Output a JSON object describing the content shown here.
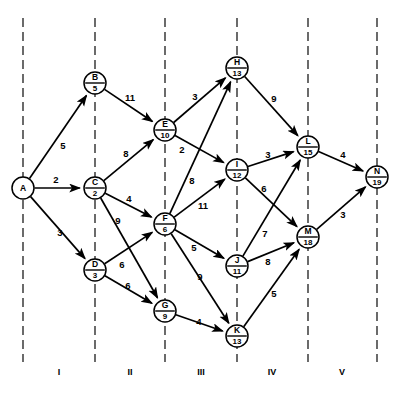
{
  "diagram": {
    "type": "activity-on-node network",
    "node_radius": 11,
    "width": 405,
    "height": 397
  },
  "chart_data": {
    "type": "diagram",
    "nodes": [
      {
        "id": "A",
        "label": "A",
        "value": "",
        "x": 23,
        "y": 188,
        "stage": 0
      },
      {
        "id": "B",
        "label": "B",
        "value": "5",
        "x": 95,
        "y": 83,
        "stage": 1
      },
      {
        "id": "C",
        "label": "C",
        "value": "2",
        "x": 95,
        "y": 188,
        "stage": 1
      },
      {
        "id": "D",
        "label": "D",
        "value": "3",
        "x": 95,
        "y": 270,
        "stage": 1
      },
      {
        "id": "E",
        "label": "E",
        "value": "10",
        "x": 165,
        "y": 130,
        "stage": 2
      },
      {
        "id": "F",
        "label": "F",
        "value": "6",
        "x": 165,
        "y": 224,
        "stage": 2
      },
      {
        "id": "G",
        "label": "G",
        "value": "9",
        "x": 165,
        "y": 311,
        "stage": 2
      },
      {
        "id": "H",
        "label": "H",
        "value": "13",
        "x": 237,
        "y": 68,
        "stage": 3
      },
      {
        "id": "I",
        "label": "I",
        "value": "12",
        "x": 237,
        "y": 170,
        "stage": 3
      },
      {
        "id": "J",
        "label": "J",
        "value": "11",
        "x": 237,
        "y": 266,
        "stage": 3
      },
      {
        "id": "K",
        "label": "K",
        "value": "13",
        "x": 237,
        "y": 336,
        "stage": 3
      },
      {
        "id": "L",
        "label": "L",
        "value": "15",
        "x": 308,
        "y": 147,
        "stage": 4
      },
      {
        "id": "M",
        "label": "M",
        "value": "18",
        "x": 308,
        "y": 237,
        "stage": 4
      },
      {
        "id": "N",
        "label": "N",
        "value": "19",
        "x": 377,
        "y": 177,
        "stage": 5
      }
    ],
    "edges": [
      {
        "from": "A",
        "to": "B",
        "weight": 5,
        "lx": 63,
        "ly": 146
      },
      {
        "from": "A",
        "to": "C",
        "weight": 2,
        "lx": 56,
        "ly": 180
      },
      {
        "from": "A",
        "to": "D",
        "weight": 3,
        "lx": 60,
        "ly": 233
      },
      {
        "from": "B",
        "to": "E",
        "weight": 11,
        "lx": 130,
        "ly": 98
      },
      {
        "from": "C",
        "to": "E",
        "weight": 8,
        "lx": 126,
        "ly": 154
      },
      {
        "from": "C",
        "to": "F",
        "weight": 4,
        "lx": 129,
        "ly": 199
      },
      {
        "from": "C",
        "to": "G",
        "weight": 9,
        "lx": 118,
        "ly": 221
      },
      {
        "from": "D",
        "to": "F",
        "weight": 6,
        "lx": 122,
        "ly": 265
      },
      {
        "from": "D",
        "to": "G",
        "weight": 6,
        "lx": 128,
        "ly": 286
      },
      {
        "from": "E",
        "to": "H",
        "weight": 3,
        "lx": 195,
        "ly": 97
      },
      {
        "from": "E",
        "to": "I",
        "weight": 2,
        "lx": 182,
        "ly": 150
      },
      {
        "from": "F",
        "to": "H",
        "weight": 8,
        "lx": 192,
        "ly": 181
      },
      {
        "from": "F",
        "to": "I",
        "weight": 11,
        "lx": 203,
        "ly": 206
      },
      {
        "from": "F",
        "to": "J",
        "weight": 5,
        "lx": 194,
        "ly": 248
      },
      {
        "from": "F",
        "to": "K",
        "weight": 9,
        "lx": 200,
        "ly": 277
      },
      {
        "from": "G",
        "to": "K",
        "weight": 4,
        "lx": 199,
        "ly": 322
      },
      {
        "from": "H",
        "to": "L",
        "weight": 9,
        "lx": 274,
        "ly": 99
      },
      {
        "from": "I",
        "to": "L",
        "weight": 3,
        "lx": 268,
        "ly": 155
      },
      {
        "from": "I",
        "to": "M",
        "weight": 6,
        "lx": 264,
        "ly": 189
      },
      {
        "from": "J",
        "to": "L",
        "weight": 7,
        "lx": 265,
        "ly": 234
      },
      {
        "from": "J",
        "to": "M",
        "weight": 8,
        "lx": 268,
        "ly": 262
      },
      {
        "from": "K",
        "to": "M",
        "weight": 5,
        "lx": 274,
        "ly": 294
      },
      {
        "from": "L",
        "to": "N",
        "weight": 4,
        "lx": 343,
        "ly": 155
      },
      {
        "from": "M",
        "to": "N",
        "weight": 3,
        "lx": 343,
        "ly": 215
      }
    ],
    "phase_lines_x": [
      23,
      95,
      165,
      237,
      308,
      377
    ],
    "phase_labels": [
      {
        "text": "I",
        "x": 59,
        "y": 373
      },
      {
        "text": "II",
        "x": 130,
        "y": 373
      },
      {
        "text": "III",
        "x": 201,
        "y": 373
      },
      {
        "text": "IV",
        "x": 272,
        "y": 373
      },
      {
        "text": "V",
        "x": 342,
        "y": 373
      }
    ],
    "colors": {
      "line": "#000000",
      "phase_line": "#1c1c1c",
      "node_fill": "#ffffff",
      "background": "#ffffff"
    }
  }
}
